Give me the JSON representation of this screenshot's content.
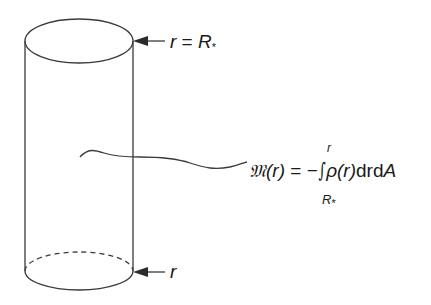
{
  "figure": {
    "colors": {
      "stroke": "#3a3a3a",
      "background": "#ffffff",
      "text": "#1a1a1a"
    },
    "labels": {
      "top": {
        "var": "r",
        "eq": " = ",
        "R": "R",
        "star": "*"
      },
      "bottom": {
        "var": "r"
      }
    },
    "equation": {
      "lhs_symbol": "𝔐",
      "lhs_arg": "(r)",
      "equals": " = −",
      "integral": "∫",
      "upper_limit": "r",
      "lower_limit_R": "R",
      "lower_limit_star": "*",
      "integrand_rho": "ρ",
      "integrand_arg": "(r)",
      "differentials": "drd",
      "area": "A"
    }
  }
}
